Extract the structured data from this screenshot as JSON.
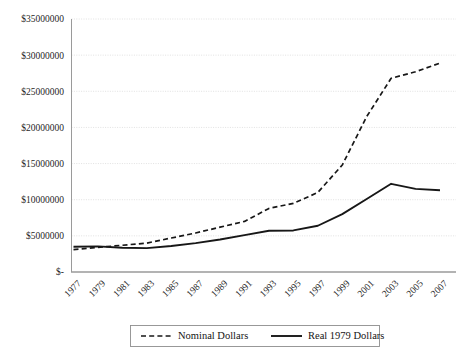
{
  "chart_data": {
    "type": "line",
    "title": "",
    "subtitle": "",
    "xlabel": "",
    "ylabel": "",
    "grid": true,
    "legend_position": "bottom",
    "ylim": [
      0,
      35000000
    ],
    "y_ticks": [
      0,
      5000000,
      10000000,
      15000000,
      20000000,
      25000000,
      30000000,
      35000000
    ],
    "y_tick_labels": [
      "$-",
      "$5000000",
      "$10000000",
      "$15000000",
      "$20000000",
      "$25000000",
      "$30000000",
      "$35000000"
    ],
    "categories": [
      "1977",
      "1979",
      "1981",
      "1983",
      "1985",
      "1987",
      "1989",
      "1991",
      "1993",
      "1995",
      "1997",
      "1999",
      "2001",
      "2003",
      "2005",
      "2007"
    ],
    "series": [
      {
        "name": "Nominal Dollars",
        "style": "dashed",
        "color": "#171717",
        "values": [
          3100000,
          3400000,
          3700000,
          4000000,
          4700000,
          5400000,
          6200000,
          7000000,
          8800000,
          9500000,
          11000000,
          14800000,
          21500000,
          26800000,
          27700000,
          28900000
        ]
      },
      {
        "name": "Real 1979 Dollars",
        "style": "solid",
        "color": "#171717",
        "values": [
          3500000,
          3550000,
          3350000,
          3300000,
          3600000,
          4000000,
          4500000,
          5100000,
          5700000,
          5750000,
          6400000,
          8000000,
          10100000,
          12200000,
          11500000,
          11300000
        ]
      }
    ]
  },
  "legend": {
    "entries": [
      {
        "label": "Nominal Dollars",
        "style": "dashed"
      },
      {
        "label": "Real 1979 Dollars",
        "style": "solid"
      }
    ]
  }
}
